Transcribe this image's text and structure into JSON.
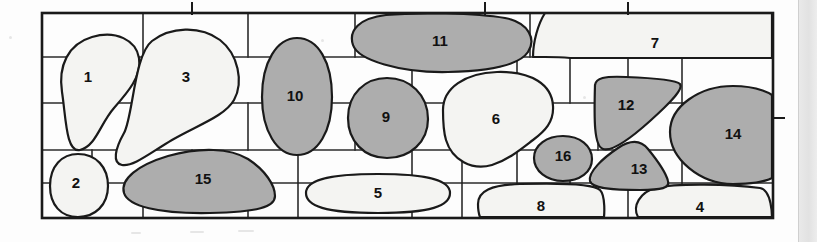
{
  "figure": {
    "frame": {
      "x": 42,
      "y": 13,
      "width": 731,
      "height": 205
    },
    "colors": {
      "background": "#fdfdfd",
      "shaded_fill": "#adadad",
      "plain_fill": "#f4f4f2",
      "outline": "#1a1a1a",
      "grid_line": "#2b2b2b",
      "right_band": "#e7e7e7"
    },
    "grid": {
      "line_width": 1.6,
      "frame_line_width": 2.6,
      "horizontal_rows_y": [
        13,
        57,
        103,
        150,
        183,
        218
      ],
      "vertical_breaks": [
        [
          92,
          143,
          192,
          248,
          298,
          355,
          412,
          462,
          517,
          570,
          628,
          682,
          728
        ],
        [
          92,
          143,
          192,
          248,
          298,
          355,
          412,
          462,
          517,
          570,
          628,
          682,
          728
        ],
        [
          92,
          143,
          192,
          248,
          298,
          355,
          412,
          462,
          517,
          570,
          628,
          682,
          728
        ],
        [
          92,
          143,
          192,
          248,
          298,
          355,
          412,
          462,
          517,
          570,
          628,
          682,
          728
        ]
      ]
    },
    "ticks": {
      "top": [
        192,
        485,
        628
      ],
      "right": [
        118
      ],
      "length": 10
    },
    "shapes": [
      {
        "id": 1,
        "label": "1",
        "fill": "plain",
        "label_x": 88,
        "label_y": 78
      },
      {
        "id": 2,
        "label": "2",
        "fill": "plain",
        "label_x": 76,
        "label_y": 184
      },
      {
        "id": 3,
        "label": "3",
        "fill": "plain",
        "label_x": 186,
        "label_y": 78
      },
      {
        "id": 4,
        "label": "4",
        "fill": "plain",
        "label_x": 700,
        "label_y": 208
      },
      {
        "id": 5,
        "label": "5",
        "fill": "plain",
        "label_x": 378,
        "label_y": 194
      },
      {
        "id": 6,
        "label": "6",
        "fill": "plain",
        "label_x": 496,
        "label_y": 120
      },
      {
        "id": 7,
        "label": "7",
        "fill": "plain",
        "label_x": 655,
        "label_y": 44
      },
      {
        "id": 8,
        "label": "8",
        "fill": "plain",
        "label_x": 541,
        "label_y": 207
      },
      {
        "id": 9,
        "label": "9",
        "fill": "shaded",
        "label_x": 386,
        "label_y": 118
      },
      {
        "id": 10,
        "label": "10",
        "fill": "shaded",
        "label_x": 295,
        "label_y": 97
      },
      {
        "id": 11,
        "label": "11",
        "fill": "shaded",
        "label_x": 440,
        "label_y": 42
      },
      {
        "id": 12,
        "label": "12",
        "fill": "shaded",
        "label_x": 626,
        "label_y": 106
      },
      {
        "id": 13,
        "label": "13",
        "fill": "shaded",
        "label_x": 639,
        "label_y": 170
      },
      {
        "id": 14,
        "label": "14",
        "fill": "shaded",
        "label_x": 733,
        "label_y": 135
      },
      {
        "id": 15,
        "label": "15",
        "fill": "shaded",
        "label_x": 203,
        "label_y": 180
      },
      {
        "id": 16,
        "label": "16",
        "fill": "shaded",
        "label_x": 563,
        "label_y": 157
      }
    ]
  }
}
